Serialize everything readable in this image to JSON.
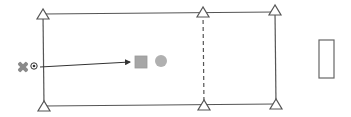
{
  "diagram": {
    "colors": {
      "line": "#555555",
      "cone_stroke": "#555555",
      "cone_fill": "#ffffff",
      "player": "#8a8a8a",
      "ball": "#333333",
      "square_fill": "#a6a6a6",
      "circle_fill": "#b0b0b0",
      "goal_stroke": "#666666"
    },
    "cones": [
      {
        "id": "top-left",
        "x": 43,
        "y": 15
      },
      {
        "id": "top-middle",
        "x": 203,
        "y": 13
      },
      {
        "id": "top-right",
        "x": 275,
        "y": 11
      },
      {
        "id": "bottom-left",
        "x": 44,
        "y": 107
      },
      {
        "id": "bottom-middle",
        "x": 204,
        "y": 106
      },
      {
        "id": "bottom-right",
        "x": 276,
        "y": 105
      }
    ],
    "lines": {
      "top": {
        "x1": 43,
        "y1": 14,
        "x2": 275,
        "y2": 12
      },
      "bottom": {
        "x1": 44,
        "y1": 106,
        "x2": 276,
        "y2": 104
      },
      "left": {
        "x1": 43,
        "y1": 14,
        "x2": 44,
        "y2": 106
      },
      "right": {
        "x1": 275,
        "y1": 12,
        "x2": 276,
        "y2": 104
      },
      "dashed_middle": {
        "x1": 203,
        "y1": 13,
        "x2": 204,
        "y2": 105
      }
    },
    "player": {
      "symbol": "X",
      "x": 23,
      "y": 67
    },
    "ball": {
      "x": 34,
      "y": 66
    },
    "pass_arrow": {
      "x1": 40,
      "y1": 67,
      "x2": 130,
      "y2": 62
    },
    "square_marker": {
      "x": 135,
      "y": 56,
      "size": 12
    },
    "circle_marker": {
      "cx": 161,
      "cy": 61,
      "r": 6
    },
    "goal": {
      "x": 319,
      "y": 40,
      "width": 15,
      "height": 38
    }
  }
}
